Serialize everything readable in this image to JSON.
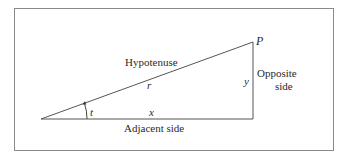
{
  "diagram": {
    "type": "right-triangle",
    "labels": {
      "vertex_top": "P",
      "hypotenuse_name": "Hypotenuse",
      "hypotenuse_var": "r",
      "opposite_var": "y",
      "opposite_name_line1": "Opposite",
      "opposite_name_line2": "side",
      "angle_var": "t",
      "adjacent_var": "x",
      "adjacent_name": "Adjacent side"
    },
    "colors": {
      "line": "#555555",
      "frame": "#8a8a8a",
      "text": "#2a2a2a"
    }
  }
}
